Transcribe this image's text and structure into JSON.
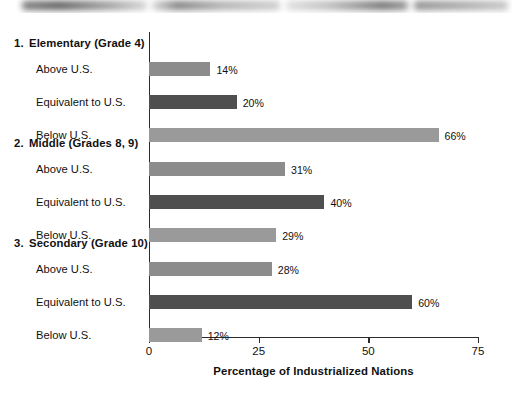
{
  "chart_data": {
    "type": "bar",
    "orientation": "horizontal",
    "title": "",
    "xlabel": "Percentage of Industrialized Nations",
    "ylabel": "",
    "xlim": [
      0,
      75
    ],
    "xticks": [
      0,
      25,
      50,
      75
    ],
    "xtick_labels": [
      "0",
      "25",
      "50",
      "75"
    ],
    "grid": false,
    "legend": "none",
    "value_suffix": "%",
    "categories": [
      "Above U.S.",
      "Equivalent to U.S.",
      "Below U.S."
    ],
    "groups": [
      {
        "number": "1.",
        "heading": "Elementary (Grade 4)",
        "bars": [
          {
            "label": "Above U.S.",
            "value": 14,
            "value_label": "14%",
            "color": "#8c8c8c"
          },
          {
            "label": "Equivalent to U.S.",
            "value": 20,
            "value_label": "20%",
            "color": "#4f4f4f"
          },
          {
            "label": "Below U.S.",
            "value": 66,
            "value_label": "66%",
            "color": "#9a9a9a"
          }
        ]
      },
      {
        "number": "2.",
        "heading": "Middle (Grades 8, 9)",
        "bars": [
          {
            "label": "Above U.S.",
            "value": 31,
            "value_label": "31%",
            "color": "#8c8c8c"
          },
          {
            "label": "Equivalent to U.S.",
            "value": 40,
            "value_label": "40%",
            "color": "#4f4f4f"
          },
          {
            "label": "Below U.S.",
            "value": 29,
            "value_label": "29%",
            "color": "#9a9a9a"
          }
        ]
      },
      {
        "number": "3.",
        "heading": "Secondary (Grade 10)",
        "bars": [
          {
            "label": "Above U.S.",
            "value": 28,
            "value_label": "28%",
            "color": "#8c8c8c"
          },
          {
            "label": "Equivalent to U.S.",
            "value": 60,
            "value_label": "60%",
            "color": "#4f4f4f"
          },
          {
            "label": "Below U.S.",
            "value": 12,
            "value_label": "12%",
            "color": "#9a9a9a"
          }
        ]
      }
    ]
  },
  "layout": {
    "axis_x0_px": 149,
    "axis_x75_px": 478,
    "axis_baseline_px": 324,
    "group_heading_y": [
      24,
      124,
      224
    ],
    "row_pitch_px": 33,
    "first_row_offset_px": 26,
    "bar_height_px": 14
  }
}
